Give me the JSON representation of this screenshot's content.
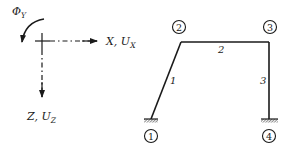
{
  "diagram": {
    "colors": {
      "ink": "#1a1a1a",
      "background": "#ffffff"
    },
    "coordinate_system": {
      "origin": [
        42,
        41
      ],
      "x_axis": {
        "label": "X",
        "sub_label": "U",
        "sub_index": "X",
        "separator": ", "
      },
      "z_axis": {
        "label": "Z",
        "sub_label": "U",
        "sub_index": "Z",
        "separator": ", "
      },
      "rotation": {
        "label": "Φ",
        "sub_index": "Y"
      }
    },
    "nodes": [
      {
        "id": "1",
        "x": 151,
        "y": 119,
        "support": "fixed"
      },
      {
        "id": "2",
        "x": 181,
        "y": 42,
        "support": "none"
      },
      {
        "id": "3",
        "x": 269,
        "y": 42,
        "support": "none"
      },
      {
        "id": "4",
        "x": 269,
        "y": 119,
        "support": "fixed"
      }
    ],
    "members": [
      {
        "id": "1",
        "from": "1",
        "to": "2"
      },
      {
        "id": "2",
        "from": "2",
        "to": "3"
      },
      {
        "id": "3",
        "from": "3",
        "to": "4"
      }
    ]
  }
}
